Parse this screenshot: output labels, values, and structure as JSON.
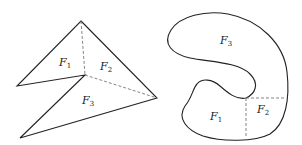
{
  "figures": [
    {
      "name": "polygon-figure",
      "regions": [
        {
          "id": "F1",
          "base": "F",
          "sub": "1"
        },
        {
          "id": "F2",
          "base": "F",
          "sub": "2"
        },
        {
          "id": "F3",
          "base": "F",
          "sub": "3"
        }
      ]
    },
    {
      "name": "blob-figure",
      "regions": [
        {
          "id": "F3",
          "base": "F",
          "sub": "3"
        },
        {
          "id": "F1",
          "base": "F",
          "sub": "1"
        },
        {
          "id": "F2",
          "base": "F",
          "sub": "2"
        }
      ]
    }
  ],
  "colors": {
    "stroke": "#222222",
    "dashed": "#777777",
    "background": "#ffffff"
  }
}
